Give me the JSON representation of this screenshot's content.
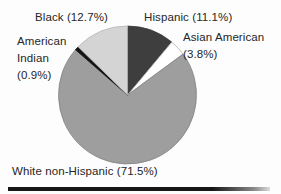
{
  "figure": {
    "background": "#fdfdfd",
    "text_color": "#262626",
    "bottom_rule_color": "#161616"
  },
  "chart_data": {
    "type": "pie",
    "title": "",
    "direction": "clockwise",
    "start_angle_deg": 0,
    "legend_position": "labels-around-pie",
    "geometry": {
      "cx": 127.5,
      "cy": 95,
      "r": 69
    },
    "slices": [
      {
        "label": "Hispanic",
        "value": 11.1,
        "display": "Hispanic (11.1%)",
        "color": "#3e3e3e",
        "stroke": "#3a3a3a"
      },
      {
        "label": "Asian American",
        "value": 3.8,
        "display": "Asian American (3.8%)",
        "color": "#ffffff",
        "stroke": "#a8a8a8"
      },
      {
        "label": "White non-Hispanic",
        "value": 71.5,
        "display": "White non-Hispanic (71.5%)",
        "color": "#9e9e9e",
        "stroke": "#7f7f7f"
      },
      {
        "label": "American Indian",
        "value": 0.9,
        "display": "American Indian (0.9%)",
        "color": "#141414",
        "stroke": "#141414"
      },
      {
        "label": "Black",
        "value": 12.7,
        "display": "Black (12.7%)",
        "color": "#d4d4d4",
        "stroke": "#b2b2b2"
      }
    ]
  },
  "labels": {
    "black": "Black (12.7%)",
    "hispanic": "Hispanic (11.1%)",
    "asian_line1": "Asian American",
    "asian_line2": "(3.8%)",
    "amind_line1": "American",
    "amind_line2": "Indian",
    "amind_line3": "(0.9%)",
    "white": "White non-Hispanic (71.5%)"
  }
}
